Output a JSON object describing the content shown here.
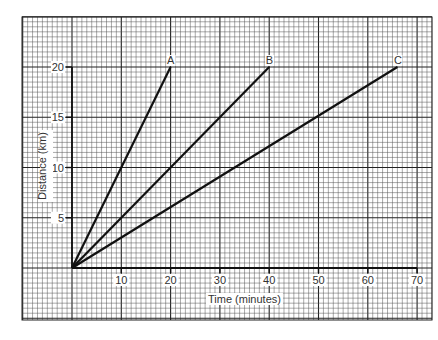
{
  "chart_data": {
    "type": "line",
    "title": "",
    "xlabel": "Time (minutes)",
    "ylabel": "Distance (km)",
    "xlim": [
      -10,
      73
    ],
    "ylim": [
      -5.2,
      25
    ],
    "x_ticks": [
      10,
      20,
      30,
      40,
      50,
      60,
      70
    ],
    "y_ticks": [
      5,
      10,
      15,
      20
    ],
    "grid": true,
    "series": [
      {
        "name": "A",
        "x": [
          0,
          20
        ],
        "y": [
          0,
          20
        ]
      },
      {
        "name": "B",
        "x": [
          0,
          40
        ],
        "y": [
          0,
          20
        ]
      },
      {
        "name": "C",
        "x": [
          0,
          66
        ],
        "y": [
          0,
          20
        ]
      }
    ]
  },
  "colors": {
    "line": "#111111",
    "grid_minor": "#555555",
    "grid_major": "#222222",
    "background": "#ffffff"
  }
}
